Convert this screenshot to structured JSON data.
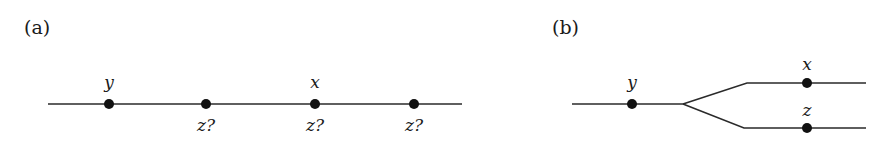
{
  "panels": [
    {
      "label": "(a)",
      "points": [
        {
          "above": "y",
          "below": ""
        },
        {
          "above": "",
          "below": "z?"
        },
        {
          "above": "x",
          "below": "z?"
        },
        {
          "above": "",
          "below": "z?"
        }
      ]
    },
    {
      "label": "(b)",
      "points": [
        {
          "label": "y",
          "branch": "trunk"
        },
        {
          "label": "x",
          "branch": "upper"
        },
        {
          "label": "z",
          "branch": "lower"
        }
      ]
    }
  ],
  "colors": {
    "ink": "#111111",
    "background": "#ffffff"
  }
}
